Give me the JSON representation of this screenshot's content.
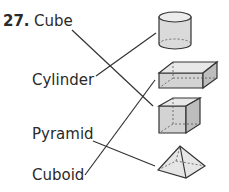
{
  "question": {
    "number": "27.",
    "left_labels": [
      "Cube",
      "Cylinder",
      "Pyramid",
      "Cuboid"
    ],
    "right_shapes": [
      "cylinder",
      "cuboid",
      "cube",
      "pyramid"
    ],
    "matches": [
      {
        "from": "Cube",
        "to": "cube"
      },
      {
        "from": "Cylinder",
        "to": "cylinder"
      },
      {
        "from": "Pyramid",
        "to": "pyramid"
      },
      {
        "from": "Cuboid",
        "to": "cuboid"
      }
    ]
  },
  "colors": {
    "text": "#2a2a2a",
    "line": "#333333",
    "shape_fill": "#d9d9d9",
    "shape_top": "#ececec",
    "shape_side": "#bdbdbd"
  }
}
